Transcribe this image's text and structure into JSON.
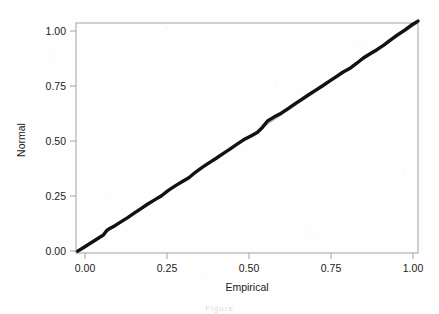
{
  "figure": {
    "width": 439,
    "height": 314,
    "background_color": "#fefefe",
    "caption_fragment": "Figure"
  },
  "chart_data": {
    "type": "line",
    "title": "",
    "subtitle": "",
    "xlabel": "Empirical",
    "ylabel": "Normal",
    "xlim": [
      0.0,
      1.0
    ],
    "ylim": [
      0.0,
      1.0
    ],
    "xticks": [
      0.0,
      0.25,
      0.5,
      0.75,
      1.0
    ],
    "yticks": [
      0.0,
      0.25,
      0.5,
      0.75,
      1.0
    ],
    "xticklabels": [
      "0.00",
      "0.25",
      "0.50",
      "0.75",
      "1.00"
    ],
    "yticklabels": [
      "0.00",
      "0.25",
      "0.50",
      "0.75",
      "1.00"
    ],
    "grid": false,
    "legend": false,
    "legend_position": "none",
    "series": [
      {
        "name": "Reference line (y = x)",
        "style": "thin-gray-line",
        "color": "#7d7d7d",
        "x": [
          0.0,
          1.0
        ],
        "y": [
          0.0,
          1.0
        ]
      },
      {
        "name": "P-P curve (Empirical vs Normal)",
        "style": "thick-black-line",
        "color": "#121212",
        "x": [
          0.005,
          0.02,
          0.035,
          0.05,
          0.065,
          0.08,
          0.09,
          0.1,
          0.115,
          0.13,
          0.15,
          0.17,
          0.19,
          0.21,
          0.23,
          0.25,
          0.27,
          0.29,
          0.31,
          0.33,
          0.35,
          0.37,
          0.39,
          0.41,
          0.43,
          0.45,
          0.47,
          0.49,
          0.51,
          0.53,
          0.545,
          0.56,
          0.58,
          0.6,
          0.62,
          0.64,
          0.66,
          0.68,
          0.7,
          0.72,
          0.74,
          0.76,
          0.78,
          0.8,
          0.82,
          0.84,
          0.86,
          0.88,
          0.9,
          0.92,
          0.94,
          0.96,
          0.98,
          1.0
        ],
        "y": [
          0.008,
          0.022,
          0.036,
          0.05,
          0.064,
          0.078,
          0.098,
          0.108,
          0.12,
          0.134,
          0.153,
          0.173,
          0.193,
          0.213,
          0.231,
          0.249,
          0.272,
          0.292,
          0.31,
          0.327,
          0.352,
          0.373,
          0.393,
          0.412,
          0.432,
          0.452,
          0.472,
          0.492,
          0.508,
          0.524,
          0.546,
          0.574,
          0.592,
          0.608,
          0.628,
          0.648,
          0.668,
          0.688,
          0.707,
          0.726,
          0.746,
          0.766,
          0.786,
          0.802,
          0.824,
          0.848,
          0.866,
          0.884,
          0.904,
          0.927,
          0.948,
          0.968,
          0.99,
          1.008
        ]
      }
    ],
    "annotations": [
      "Curve shows a slight step near Empirical = 0.09",
      "Curve rises above the reference diagonal between Empirical 0.53 and 0.60"
    ]
  },
  "axes_geometry": {
    "panel_left": 76,
    "panel_right": 418,
    "panel_top": 23,
    "panel_bottom": 253
  }
}
